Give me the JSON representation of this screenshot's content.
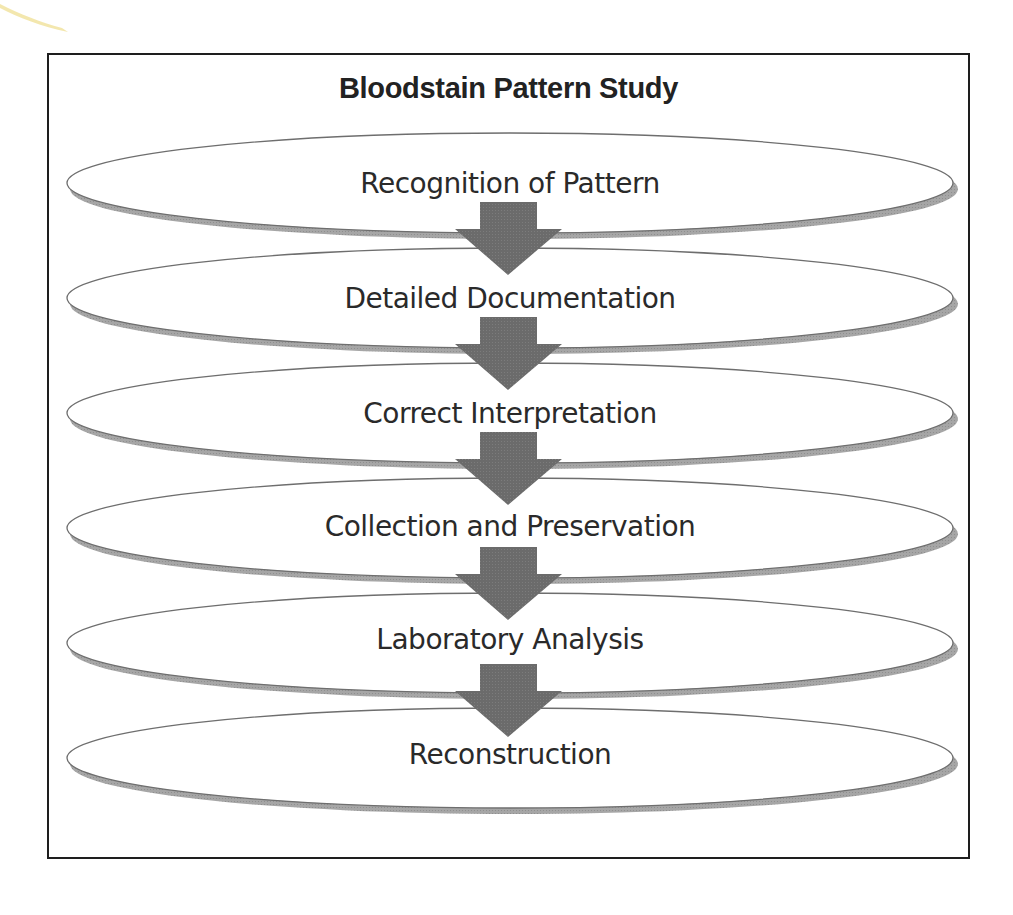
{
  "diagram": {
    "title": "Bloodstain Pattern Study",
    "steps": [
      {
        "label": "Recognition of Pattern"
      },
      {
        "label": "Detailed Documentation"
      },
      {
        "label": "Correct Interpretation"
      },
      {
        "label": "Collection and Preservation"
      },
      {
        "label": "Laboratory Analysis"
      },
      {
        "label": "Reconstruction"
      }
    ],
    "connectors": [
      {
        "from": "Recognition of Pattern",
        "to": "Detailed Documentation",
        "icon": "down-arrow-icon"
      },
      {
        "from": "Detailed Documentation",
        "to": "Correct Interpretation",
        "icon": "down-arrow-icon"
      },
      {
        "from": "Correct Interpretation",
        "to": "Collection and Preservation",
        "icon": "down-arrow-icon"
      },
      {
        "from": "Collection and Preservation",
        "to": "Laboratory Analysis",
        "icon": "down-arrow-icon"
      },
      {
        "from": "Laboratory Analysis",
        "to": "Reconstruction",
        "icon": "down-arrow-icon"
      }
    ],
    "colors": {
      "frame": "#1e1e1e",
      "ellipse_fill": "#ffffff",
      "ellipse_stroke": "#6e6e6e",
      "ellipse_shadow": "#a3a3a3",
      "arrow": "#6b6b6b",
      "text": "#2a2a2a",
      "page_curl": "#f3e7a6"
    }
  }
}
